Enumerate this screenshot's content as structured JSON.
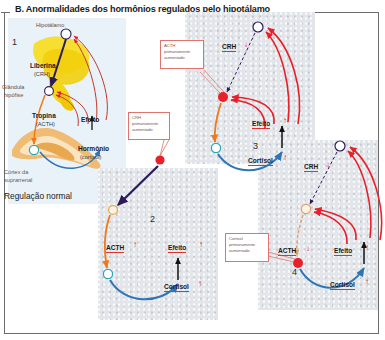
{
  "figure": {
    "title": "B. Anormalidades dos hormônios regulados pelo hipotálamo",
    "caption_normal": "Regulação normal"
  },
  "panel1": {
    "number": "1",
    "labels": {
      "hypothalamus": "Hipotálamo",
      "liberin": "Liberina",
      "liberin_sub": "(CRH)",
      "pituitary": "Glândula",
      "pituitary2": "hipófise",
      "tropin": "Tropina",
      "tropin_sub": "(ACTH)",
      "effect": "Efeito",
      "hormone": "Hormônio",
      "hormone_sub": "(cortisol)",
      "cortex": "Córtex da",
      "cortex2": "suprarrenal"
    }
  },
  "panel2": {
    "number": "2",
    "callout": [
      "CRH",
      "primariamente",
      "aumentado"
    ],
    "acth_label": "ACTH",
    "acth_trend": "↑",
    "effect_label": "Efeito",
    "effect_trend": "↑",
    "cortisol_label": "Cortisol",
    "cortisol_trend": "↑"
  },
  "panel3": {
    "number": "3",
    "callout": [
      "ACTH",
      "primariamente",
      "aumentado"
    ],
    "crh_label": "CRH",
    "crh_trend": "↓",
    "effect_label": "Efeito",
    "effect_trend": "↑",
    "cortisol_label": "Cortisol",
    "cortisol_trend": "↑"
  },
  "panel4": {
    "number": "4",
    "callout": [
      "Cortisol",
      "primariamente",
      "aumentado"
    ],
    "crh_label": "CRH",
    "crh_trend": "↓",
    "acth_label": "ACTH",
    "acth_trend": "↓",
    "effect_label": "Efeito",
    "effect_trend": "↑",
    "cortisol_label": "Cortisol",
    "cortisol_trend": "↑"
  },
  "colors": {
    "stimulatory_red": "#e8202a",
    "feedback_blue": "#2f74b5",
    "tropin_orange": "#f07818",
    "crh_navy": "#2b1a5e",
    "node_outline_teal": "#2aa8b8",
    "anatomy_yellow": "#f5d517",
    "anatomy_tan": "#e8a84f",
    "callout_border": "#e0736b"
  }
}
